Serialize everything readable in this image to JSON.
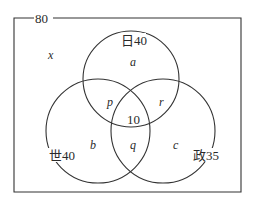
{
  "universe": {
    "label": "80"
  },
  "sets": {
    "japanese_history": {
      "label": "日40",
      "name": "日",
      "count": "40"
    },
    "world_history": {
      "label": "世40",
      "name": "世",
      "count": "40"
    },
    "politics": {
      "label": "政35",
      "name": "政",
      "count": "35"
    }
  },
  "regions": {
    "outside": "x",
    "only_top": "a",
    "only_left": "b",
    "only_right": "c",
    "top_left": "p",
    "top_right": "r",
    "left_right": "q",
    "center": "10"
  },
  "colors": {
    "line": "#333333",
    "text": "#2a2a2a",
    "background": "#ffffff"
  }
}
